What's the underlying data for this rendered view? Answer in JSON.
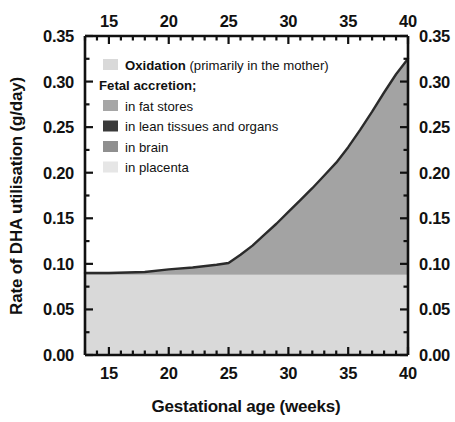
{
  "chart_data": {
    "type": "area",
    "title": "",
    "xlabel": "Gestational age (weeks)",
    "ylabel": "Rate of DHA utilisation (g/day)",
    "xlim": [
      13,
      40
    ],
    "ylim": [
      0.0,
      0.35
    ],
    "grid": false,
    "x_ticks": [
      15,
      20,
      25,
      30,
      35,
      40
    ],
    "x_tick_labels": [
      "15",
      "20",
      "25",
      "30",
      "35",
      "40"
    ],
    "x_minor_step": 1,
    "y_ticks": [
      0.0,
      0.05,
      0.1,
      0.15,
      0.2,
      0.25,
      0.3,
      0.35
    ],
    "y_tick_labels": [
      "0.00",
      "0.05",
      "0.10",
      "0.15",
      "0.20",
      "0.25",
      "0.30",
      "0.35"
    ],
    "y_minor_step": 0.025,
    "top_axis_mirrored": true,
    "right_axis_mirrored": true,
    "legend_position": "upper-left inside axes",
    "x": [
      13,
      15,
      18,
      20,
      22,
      24,
      25,
      26,
      27,
      28,
      29,
      30,
      31,
      32,
      33,
      34,
      35,
      36,
      37,
      38,
      39,
      40
    ],
    "series": [
      {
        "name": "Oxidation (primarily in the mother)",
        "color": "#d9d9d9",
        "values": [
          0.088,
          0.088,
          0.088,
          0.088,
          0.088,
          0.088,
          0.088,
          0.088,
          0.088,
          0.088,
          0.088,
          0.088,
          0.088,
          0.088,
          0.088,
          0.088,
          0.088,
          0.088,
          0.088,
          0.088,
          0.088,
          0.088
        ]
      },
      {
        "name": "in placenta",
        "color": "#e6e6e6",
        "values": [
          0.002,
          0.002,
          0.002,
          0.003,
          0.003,
          0.004,
          0.004,
          0.004,
          0.004,
          0.004,
          0.004,
          0.004,
          0.004,
          0.004,
          0.004,
          0.004,
          0.004,
          0.004,
          0.004,
          0.004,
          0.004,
          0.004
        ]
      },
      {
        "name": "in brain",
        "color": "#8f8f8f",
        "values": [
          0.0,
          0.0,
          0.001,
          0.002,
          0.003,
          0.004,
          0.005,
          0.009,
          0.013,
          0.018,
          0.023,
          0.028,
          0.033,
          0.038,
          0.043,
          0.048,
          0.052,
          0.056,
          0.06,
          0.064,
          0.068,
          0.072
        ]
      },
      {
        "name": "in lean tissues and organs",
        "color": "#3a3a3a",
        "values": [
          0.0,
          0.0,
          0.0,
          0.001,
          0.001,
          0.002,
          0.002,
          0.004,
          0.006,
          0.008,
          0.01,
          0.012,
          0.014,
          0.016,
          0.018,
          0.02,
          0.022,
          0.024,
          0.026,
          0.028,
          0.03,
          0.032
        ]
      },
      {
        "name": "in fat stores",
        "color": "#a6a6a6",
        "values": [
          0.0,
          0.0,
          0.0,
          0.0,
          0.001,
          0.001,
          0.002,
          0.005,
          0.009,
          0.014,
          0.019,
          0.025,
          0.031,
          0.037,
          0.044,
          0.051,
          0.062,
          0.075,
          0.089,
          0.104,
          0.118,
          0.129
        ]
      }
    ],
    "total_values": [
      0.09,
      0.09,
      0.091,
      0.094,
      0.096,
      0.099,
      0.101,
      0.11,
      0.12,
      0.132,
      0.144,
      0.157,
      0.17,
      0.183,
      0.197,
      0.211,
      0.228,
      0.247,
      0.267,
      0.288,
      0.308,
      0.325
    ],
    "notes": {
      "baseline_oxidation_level": 0.09,
      "plateau_until_week": 25,
      "inflection_week": 34,
      "final_value_week_40": 0.325
    }
  },
  "legend": {
    "items": [
      {
        "swatch_color": "#d9d9d9",
        "label_bold": "Oxidation",
        "label_rest": "(primarily in the mother)",
        "swatch_name": "oxidation-swatch"
      },
      {
        "swatch_color": null,
        "label_bold": "Fetal accretion;",
        "label_rest": "",
        "swatch_name": "fetal-accretion-header"
      },
      {
        "swatch_color": "#a6a6a6",
        "label_bold": "",
        "label_rest": "in fat stores",
        "swatch_name": "fat-stores-swatch"
      },
      {
        "swatch_color": "#3a3a3a",
        "label_bold": "",
        "label_rest": "in lean tissues and organs",
        "swatch_name": "lean-tissues-swatch"
      },
      {
        "swatch_color": "#8f8f8f",
        "label_bold": "",
        "label_rest": "in brain",
        "swatch_name": "brain-swatch"
      },
      {
        "swatch_color": "#e6e6e6",
        "label_bold": "",
        "label_rest": "in placenta",
        "swatch_name": "placenta-swatch"
      }
    ]
  },
  "axes": {
    "x_title": "Gestational age (weeks)",
    "y_title": "Rate of DHA utilisation (g/day)",
    "x_labels_bottom": [
      "15",
      "20",
      "25",
      "30",
      "35",
      "40"
    ],
    "x_labels_top": [
      "15",
      "20",
      "25",
      "30",
      "35",
      "40"
    ],
    "y_labels_left": [
      "0.35",
      "0.30",
      "0.25",
      "0.20",
      "0.15",
      "0.10",
      "0.05",
      "0.00"
    ],
    "y_labels_right": [
      "0.35",
      "0.30",
      "0.25",
      "0.20",
      "0.15",
      "0.10",
      "0.05",
      "0.00"
    ]
  },
  "colors": {
    "axis": "#111111",
    "background": "#ffffff",
    "curve_line": "#2b2b2b",
    "area_fill": "#a3a3a3",
    "baseline_fill": "#d9d9d9"
  }
}
